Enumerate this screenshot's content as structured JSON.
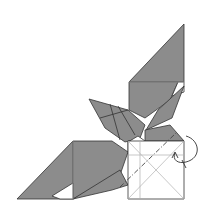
{
  "diagram": {
    "type": "origami-fold-step",
    "colors": {
      "paper_colored": "#8c8c8c",
      "paper_white": "#ffffff",
      "edge": "#333333",
      "crease": "#b0b0b0",
      "fold_line": "#444444"
    },
    "annotations": {
      "fold_type": "valley-fold-behind",
      "arrow": "curved-fold-arrow"
    }
  }
}
